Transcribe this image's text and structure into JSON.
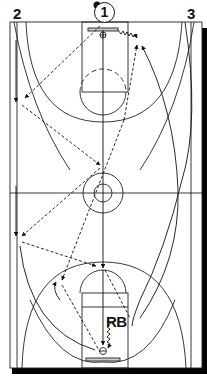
{
  "diagram": {
    "type": "basketball-full-court-drill",
    "colors": {
      "line": "#111111",
      "background": "#ffffff",
      "shadow": "#000000"
    },
    "players": [
      {
        "id": "p1",
        "label": "1",
        "style": "circled",
        "has_ball": true
      },
      {
        "id": "p2",
        "label": "2",
        "style": "plain"
      },
      {
        "id": "p3",
        "label": "3",
        "style": "plain"
      },
      {
        "id": "rb",
        "label": "RB",
        "style": "plain"
      }
    ],
    "legend": {
      "dashed_arrow": "pass",
      "solid_arrow": "cut",
      "zigzag_arrow": "dribble"
    }
  }
}
